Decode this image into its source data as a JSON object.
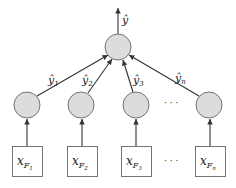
{
  "diagram": {
    "type": "ensemble-network",
    "output": {
      "label": "ŷ"
    },
    "aggregator": {
      "fill": "#dcdcdc"
    },
    "edge_labels": [
      {
        "base": "ŷ",
        "sub": "1"
      },
      {
        "base": "ŷ",
        "sub": "2"
      },
      {
        "base": "ŷ",
        "sub": "3"
      },
      {
        "base": "ŷ",
        "sub": "n"
      }
    ],
    "inputs": [
      {
        "base": "x",
        "sub": "F",
        "subsub": "1"
      },
      {
        "base": "x",
        "sub": "F",
        "subsub": "2"
      },
      {
        "base": "x",
        "sub": "F",
        "subsub": "3"
      },
      {
        "base": "x",
        "sub": "F",
        "subsub": "n"
      }
    ],
    "ellipsis": "· · ·",
    "colors": {
      "node_fill": "#dcdcdc",
      "stroke": "#333333"
    }
  }
}
